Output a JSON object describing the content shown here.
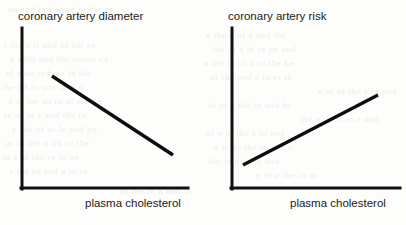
{
  "page": {
    "width": 406,
    "height": 225,
    "background_color": "#fdfdfc",
    "ink_color": "#111111",
    "bleed_color": "#ededea"
  },
  "figure": {
    "kind": "two-panel schematic line diagram",
    "shared_xlabel": "plasma cholesterol"
  },
  "bleed_through": [
    {
      "text": "an and in  t  were  to  the  m",
      "x": 8,
      "y": 4
    },
    {
      "text": "t  the  o  it  and  of  for  ea",
      "x": 4,
      "y": 40
    },
    {
      "text": "e  with  and  the  tween  ca",
      "x": 10,
      "y": 54
    },
    {
      "text": "ul  a  on  reduce  in  the",
      "x": 6,
      "y": 68
    },
    {
      "text": "the  nd  lo  wer  of  a  b",
      "x": 2,
      "y": 82
    },
    {
      "text": "d  m  the  an  to  of  the  he",
      "x": 8,
      "y": 96
    },
    {
      "text": "re  of  to  e  and  the  in",
      "x": 4,
      "y": 110
    },
    {
      "text": "y  the  of  as  le  and  po",
      "x": 12,
      "y": 124
    },
    {
      "text": "at  in  the  a  ith  of  the",
      "x": 6,
      "y": 138
    },
    {
      "text": "in  a  of  the  re  to  an",
      "x": 2,
      "y": 152
    },
    {
      "text": "r  the  of  and  a  in  to",
      "x": 10,
      "y": 166
    },
    {
      "text": "n  the  e  of  a  and  the",
      "x": 206,
      "y": 30
    },
    {
      "text": "the  of  a  in  re  on  and",
      "x": 212,
      "y": 44
    },
    {
      "text": "a  the  in  of  d  to  the  be",
      "x": 204,
      "y": 58
    },
    {
      "text": "of  the  and  a  in  er  th",
      "x": 210,
      "y": 72
    },
    {
      "text": "e  to  of  the  a  in  and",
      "x": 318,
      "y": 86
    },
    {
      "text": "in  of  a  the  to  and  be",
      "x": 208,
      "y": 100
    },
    {
      "text": "the  a  of  in  to  e  and",
      "x": 300,
      "y": 114
    },
    {
      "text": "of  e  in  the  a  to  and",
      "x": 206,
      "y": 128
    },
    {
      "text": "a  in  of  the  to  and  e",
      "x": 214,
      "y": 142
    },
    {
      "text": "the  in  of  a  to  and",
      "x": 208,
      "y": 156
    },
    {
      "text": "e  of  a  the  in  to",
      "x": 256,
      "y": 170
    },
    {
      "text": "of  the  in  a  and  to",
      "x": 120,
      "y": 186
    }
  ],
  "chart_data": [
    {
      "id": "coronary-artery-diameter",
      "type": "line",
      "title": "coronary artery diameter",
      "xlabel": "plasma cholesterol",
      "ylabel": "coronary artery diameter",
      "grid": false,
      "legend": "none",
      "axis_ticks": false,
      "trend": "decreasing",
      "relationship": "inverse",
      "x": [
        0.25,
        1.0
      ],
      "y": [
        0.68,
        0.2
      ],
      "series": [
        {
          "name": "coronary artery diameter vs plasma cholesterol",
          "values": [
            0.68,
            0.2
          ]
        }
      ],
      "xlim": [
        0,
        1
      ],
      "ylim": [
        0,
        1
      ],
      "geometry": {
        "y_axis": {
          "x": 22,
          "y_top": 28,
          "y_bottom": 189
        },
        "x_axis": {
          "y": 188,
          "x_left": 22,
          "x_right": 188
        },
        "line": {
          "x1": 52,
          "y1": 76,
          "x2": 173,
          "y2": 155
        },
        "title_pos": {
          "x": 18,
          "y": 10
        },
        "xlabel_pos": {
          "x": 85,
          "y": 197
        }
      }
    },
    {
      "id": "coronary-artery-risk",
      "type": "line",
      "title": "coronary artery risk",
      "xlabel": "plasma cholesterol",
      "ylabel": "coronary artery risk",
      "grid": false,
      "legend": "none",
      "axis_ticks": false,
      "trend": "increasing",
      "relationship": "direct",
      "x": [
        0.08,
        0.9
      ],
      "y": [
        0.15,
        0.58
      ],
      "series": [
        {
          "name": "coronary artery risk vs plasma cholesterol",
          "values": [
            0.15,
            0.58
          ]
        }
      ],
      "xlim": [
        0,
        1
      ],
      "ylim": [
        0,
        1
      ],
      "geometry": {
        "y_axis": {
          "x": 232,
          "y_top": 28,
          "y_bottom": 189
        },
        "x_axis": {
          "y": 188,
          "x_left": 232,
          "x_right": 400
        },
        "line": {
          "x1": 243,
          "y1": 165,
          "x2": 378,
          "y2": 95
        },
        "title_pos": {
          "x": 228,
          "y": 10
        },
        "xlabel_pos": {
          "x": 290,
          "y": 197
        }
      }
    }
  ]
}
